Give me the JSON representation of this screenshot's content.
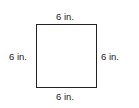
{
  "diagram": {
    "shape": "square",
    "sides": {
      "top": "6 in.",
      "bottom": "6 in.",
      "left": "6 in.",
      "right": "6 in."
    }
  }
}
